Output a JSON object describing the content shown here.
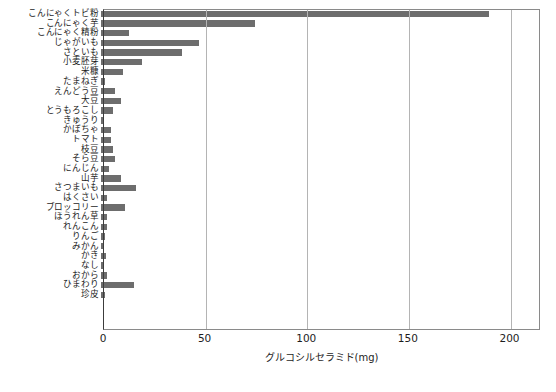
{
  "chart_data": {
    "type": "bar",
    "orientation": "horizontal",
    "title": "",
    "xlabel": "グルコシルセラミド(mg)",
    "ylabel": "",
    "xlim": [
      0,
      215
    ],
    "xticks": [
      0,
      50,
      100,
      150,
      200
    ],
    "xtick_labels": [
      "0",
      "50",
      "100",
      "150",
      "200"
    ],
    "grid": "vertical",
    "legend": "none",
    "bar_color": "#6d6d6d",
    "categories": [
      "こんにゃくトビ粉",
      "こんにゃく芋",
      "こんにゃく精粉",
      "じゃがいも",
      "さといも",
      "小麦胚芽",
      "米糠",
      "たまねぎ",
      "えんどう豆",
      "大豆",
      "とうもろこし",
      "きゅうり",
      "かぼちゃ",
      "トマト",
      "枝豆",
      "そら豆",
      "にんじん",
      "山芋",
      "さつまいも",
      "はくさい",
      "ブロッコリー",
      "ほうれん草",
      "れんこん",
      "りんご",
      "みかん",
      "かき",
      "なし",
      "おから",
      "ひまわり",
      "珍皮"
    ],
    "values": [
      191,
      76,
      14,
      48,
      40,
      20,
      11,
      2,
      7,
      10,
      6,
      1.5,
      5,
      5,
      6,
      7,
      4,
      10,
      17,
      3,
      12,
      3,
      3,
      2,
      1.5,
      2.5,
      1,
      3,
      16,
      2
    ]
  },
  "caption": {
    "text": ""
  }
}
